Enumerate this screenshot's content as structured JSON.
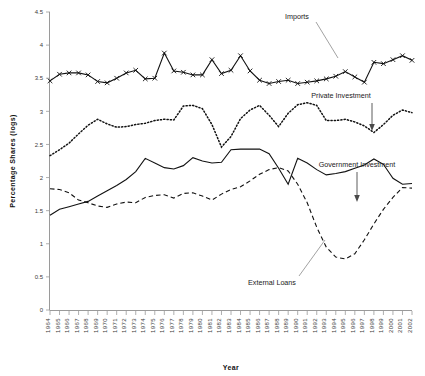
{
  "chart_data": {
    "type": "line",
    "title": "",
    "xlabel": "Year",
    "ylabel": "Percentage  Shares  (logs)",
    "ylim": [
      0,
      4.5
    ],
    "yticks": [
      "0",
      "0.5",
      "1",
      "1.5",
      "2",
      "2.5",
      "3",
      "3.5",
      "4",
      "4.5"
    ],
    "grid": false,
    "legend_position": "inline-annotations",
    "x": [
      "1964",
      "1965",
      "1966",
      "1967",
      "1968",
      "1969",
      "1970",
      "1971",
      "1972",
      "1973",
      "1974",
      "1975",
      "1976",
      "1977",
      "1978",
      "1979",
      "1980",
      "1981",
      "1982",
      "1983",
      "1984",
      "1985",
      "1986",
      "1987",
      "1988",
      "1989",
      "1990",
      "1991",
      "1992",
      "1993",
      "1994",
      "1995",
      "1996",
      "1997",
      "1998",
      "1999",
      "2000",
      "2001",
      "2002"
    ],
    "series": [
      {
        "name": "Imports",
        "style": "solid-with-x-markers",
        "marker": "x",
        "values": [
          3.46,
          3.56,
          3.58,
          3.58,
          3.55,
          3.45,
          3.43,
          3.5,
          3.58,
          3.62,
          3.49,
          3.5,
          3.88,
          3.61,
          3.59,
          3.55,
          3.55,
          3.78,
          3.57,
          3.62,
          3.84,
          3.61,
          3.47,
          3.42,
          3.45,
          3.47,
          3.42,
          3.44,
          3.46,
          3.49,
          3.53,
          3.6,
          3.52,
          3.44,
          3.74,
          3.72,
          3.78,
          3.84,
          3.77
        ]
      },
      {
        "name": "Private Investment",
        "style": "dotted",
        "marker": "none",
        "values": [
          2.33,
          2.42,
          2.52,
          2.66,
          2.79,
          2.88,
          2.81,
          2.76,
          2.77,
          2.8,
          2.82,
          2.86,
          2.88,
          2.87,
          3.08,
          3.09,
          3.04,
          2.8,
          2.46,
          2.62,
          2.89,
          3.02,
          3.09,
          2.94,
          2.77,
          2.97,
          3.1,
          3.13,
          3.09,
          2.86,
          2.86,
          2.88,
          2.84,
          2.78,
          2.68,
          2.8,
          2.94,
          3.02,
          2.98
        ]
      },
      {
        "name": "Government Investment",
        "style": "solid",
        "marker": "none",
        "values": [
          1.43,
          1.52,
          1.56,
          1.6,
          1.64,
          1.72,
          1.8,
          1.88,
          1.97,
          2.09,
          2.29,
          2.22,
          2.15,
          2.13,
          2.18,
          2.3,
          2.25,
          2.22,
          2.23,
          2.42,
          2.43,
          2.43,
          2.43,
          2.36,
          2.14,
          1.9,
          2.29,
          2.22,
          2.12,
          2.04,
          2.06,
          2.09,
          2.14,
          2.19,
          2.28,
          2.2,
          1.99,
          1.9,
          1.91
        ]
      },
      {
        "name": "External Loans",
        "style": "dashed",
        "marker": "none",
        "values": [
          1.83,
          1.82,
          1.77,
          1.66,
          1.62,
          1.57,
          1.55,
          1.6,
          1.63,
          1.62,
          1.7,
          1.73,
          1.74,
          1.69,
          1.76,
          1.77,
          1.72,
          1.66,
          1.75,
          1.82,
          1.86,
          1.95,
          2.05,
          2.12,
          2.15,
          2.1,
          1.9,
          1.62,
          1.25,
          0.95,
          0.8,
          0.77,
          0.85,
          1.06,
          1.3,
          1.52,
          1.7,
          1.85,
          1.84
        ]
      }
    ],
    "annotations": [
      {
        "name": "imports-label",
        "text": "Imports"
      },
      {
        "name": "private-investment-label",
        "text": "Private Investment"
      },
      {
        "name": "government-investment-label",
        "text": "Government Investment"
      },
      {
        "name": "external-loans-label",
        "text": "External Loans"
      }
    ]
  }
}
